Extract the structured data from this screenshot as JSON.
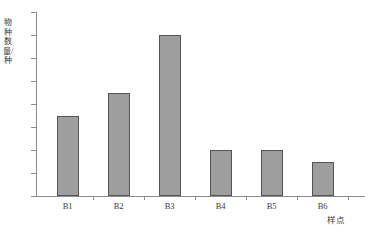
{
  "chart_data": {
    "type": "bar",
    "title": "",
    "subtitle": "",
    "categories": [
      "B1",
      "B2",
      "B3",
      "B4",
      "B5",
      "B6"
    ],
    "values": [
      7,
      9,
      14,
      4,
      4,
      3
    ],
    "series": [
      {
        "name": "物种数量",
        "values": [
          7,
          9,
          14,
          4,
          4,
          3
        ]
      }
    ],
    "xlabel": "样点",
    "ylabel": "物种数量/种",
    "ylim": [
      0,
      16
    ],
    "yticks": [
      0,
      2,
      4,
      6,
      8,
      10,
      12,
      14,
      16
    ],
    "ytick_labels": [
      "0",
      "2",
      "4",
      "6",
      "8",
      "10",
      "12",
      "14",
      "16"
    ],
    "grid": false,
    "legend": false,
    "legend_position": "none",
    "bar_fill_color": "#9e9e9e",
    "bar_border_color": "#555555",
    "axis_color": "#8d8d8d",
    "background_color": "#ffffff"
  }
}
